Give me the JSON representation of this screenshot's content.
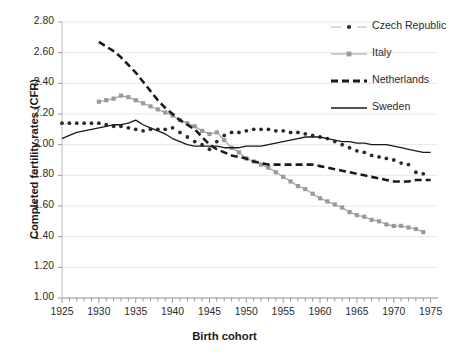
{
  "chart_data": {
    "type": "line",
    "title": "",
    "xlabel": "Birth cohort",
    "ylabel": "Completed fertility rates (CFR)",
    "xlim": [
      1925,
      1976
    ],
    "ylim": [
      1.0,
      2.8
    ],
    "ytick_labels": [
      "1.00",
      "1.20",
      "1.40",
      "1.60",
      "1.80",
      "2.00",
      "2.20",
      "2.40",
      "2.60",
      "2.80"
    ],
    "ytick_values": [
      1.0,
      1.2,
      1.4,
      1.6,
      1.8,
      2.0,
      2.2,
      2.4,
      2.6,
      2.8
    ],
    "xtick_labels": [
      "1925",
      "1930",
      "1935",
      "1940",
      "1945",
      "1950",
      "1955",
      "1960",
      "1965",
      "1970",
      "1975"
    ],
    "xtick_values": [
      1925,
      1930,
      1935,
      1940,
      1945,
      1950,
      1955,
      1960,
      1965,
      1970,
      1975
    ],
    "minor_x_ticks": true,
    "grid": "horizontal",
    "legend_position": "top-right",
    "series": [
      {
        "name": "Czech Republic",
        "color": "#2b2b2b",
        "style": "dotted-markers",
        "x": [
          1925,
          1926,
          1927,
          1928,
          1929,
          1930,
          1931,
          1932,
          1933,
          1934,
          1935,
          1936,
          1937,
          1938,
          1939,
          1940,
          1941,
          1942,
          1943,
          1944,
          1945,
          1946,
          1947,
          1948,
          1949,
          1950,
          1951,
          1952,
          1953,
          1954,
          1955,
          1956,
          1957,
          1958,
          1959,
          1960,
          1961,
          1962,
          1963,
          1964,
          1965,
          1966,
          1967,
          1968,
          1969,
          1970,
          1971,
          1972,
          1973,
          1974
        ],
        "values": [
          2.14,
          2.14,
          2.14,
          2.14,
          2.14,
          2.14,
          2.13,
          2.12,
          2.12,
          2.11,
          2.1,
          2.09,
          2.1,
          2.1,
          2.1,
          2.11,
          2.08,
          2.05,
          2.02,
          2.0,
          1.97,
          2.02,
          2.06,
          2.08,
          2.08,
          2.09,
          2.1,
          2.1,
          2.1,
          2.09,
          2.09,
          2.08,
          2.08,
          2.07,
          2.06,
          2.05,
          2.04,
          2.02,
          2.0,
          1.98,
          1.96,
          1.95,
          1.93,
          1.92,
          1.91,
          1.9,
          1.88,
          1.87,
          1.82,
          1.81
        ]
      },
      {
        "name": "Italy",
        "color": "#9a9a9a",
        "style": "line-markers",
        "x": [
          1930,
          1931,
          1932,
          1933,
          1934,
          1935,
          1936,
          1937,
          1938,
          1939,
          1940,
          1941,
          1942,
          1943,
          1944,
          1945,
          1946,
          1947,
          1948,
          1949,
          1950,
          1951,
          1952,
          1953,
          1954,
          1955,
          1956,
          1957,
          1958,
          1959,
          1960,
          1961,
          1962,
          1963,
          1964,
          1965,
          1966,
          1967,
          1968,
          1969,
          1970,
          1971,
          1972,
          1973,
          1974
        ],
        "values": [
          2.28,
          2.29,
          2.3,
          2.32,
          2.31,
          2.29,
          2.27,
          2.25,
          2.23,
          2.21,
          2.19,
          2.16,
          2.14,
          2.12,
          2.09,
          2.07,
          2.08,
          2.03,
          1.98,
          1.95,
          1.91,
          1.89,
          1.87,
          1.85,
          1.82,
          1.79,
          1.76,
          1.73,
          1.71,
          1.68,
          1.65,
          1.63,
          1.61,
          1.59,
          1.56,
          1.54,
          1.53,
          1.51,
          1.5,
          1.48,
          1.47,
          1.47,
          1.46,
          1.45,
          1.43
        ]
      },
      {
        "name": "Netherlands",
        "color": "#1a1a1a",
        "style": "dashed",
        "x": [
          1930,
          1931,
          1932,
          1933,
          1934,
          1935,
          1936,
          1937,
          1938,
          1939,
          1940,
          1941,
          1942,
          1943,
          1944,
          1945,
          1946,
          1947,
          1948,
          1949,
          1950,
          1951,
          1952,
          1953,
          1954,
          1955,
          1956,
          1957,
          1958,
          1959,
          1960,
          1961,
          1962,
          1963,
          1964,
          1965,
          1966,
          1967,
          1968,
          1969,
          1970,
          1971,
          1972,
          1973,
          1974,
          1975
        ],
        "values": [
          2.67,
          2.64,
          2.61,
          2.57,
          2.52,
          2.47,
          2.41,
          2.35,
          2.29,
          2.24,
          2.2,
          2.16,
          2.13,
          2.1,
          2.05,
          2.0,
          1.97,
          1.95,
          1.93,
          1.92,
          1.91,
          1.89,
          1.88,
          1.87,
          1.87,
          1.87,
          1.87,
          1.87,
          1.87,
          1.87,
          1.86,
          1.85,
          1.84,
          1.83,
          1.82,
          1.81,
          1.8,
          1.79,
          1.78,
          1.77,
          1.76,
          1.76,
          1.76,
          1.77,
          1.77,
          1.77
        ]
      },
      {
        "name": "Sweden",
        "color": "#1a1a1a",
        "style": "solid",
        "x": [
          1925,
          1926,
          1927,
          1928,
          1929,
          1930,
          1931,
          1932,
          1933,
          1934,
          1935,
          1936,
          1937,
          1938,
          1939,
          1940,
          1941,
          1942,
          1943,
          1944,
          1945,
          1946,
          1947,
          1948,
          1949,
          1950,
          1951,
          1952,
          1953,
          1954,
          1955,
          1956,
          1957,
          1958,
          1959,
          1960,
          1961,
          1962,
          1963,
          1964,
          1965,
          1966,
          1967,
          1968,
          1969,
          1970,
          1971,
          1972,
          1973,
          1974,
          1975
        ],
        "values": [
          2.04,
          2.06,
          2.08,
          2.09,
          2.1,
          2.11,
          2.12,
          2.13,
          2.13,
          2.14,
          2.16,
          2.13,
          2.11,
          2.09,
          2.07,
          2.04,
          2.02,
          2.0,
          1.99,
          1.99,
          1.99,
          1.99,
          1.98,
          1.98,
          1.98,
          1.99,
          1.99,
          1.99,
          2.0,
          2.01,
          2.02,
          2.03,
          2.04,
          2.05,
          2.05,
          2.05,
          2.04,
          2.03,
          2.02,
          2.02,
          2.01,
          2.01,
          2.0,
          2.0,
          2.0,
          1.99,
          1.98,
          1.97,
          1.96,
          1.95,
          1.95
        ]
      }
    ]
  },
  "legend": {
    "items": [
      {
        "label": "Czech Republic"
      },
      {
        "label": "Italy"
      },
      {
        "label": "Netherlands"
      },
      {
        "label": "Sweden"
      }
    ]
  }
}
